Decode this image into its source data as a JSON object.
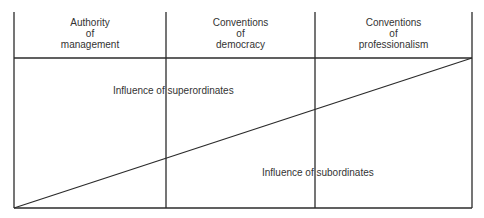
{
  "diagram": {
    "columns": [
      {
        "lines": [
          "Authority",
          "of",
          "management"
        ]
      },
      {
        "lines": [
          "Conventions",
          "of",
          "democracy"
        ]
      },
      {
        "lines": [
          "Conventions",
          "of",
          "professionalism"
        ]
      }
    ],
    "labels": {
      "superordinates": "Influence of superordinates",
      "subordinates": "Influence of subordinates"
    },
    "geometry": {
      "left_x": 14,
      "divider1_x": 166,
      "divider2_x": 315,
      "right_x": 472,
      "top_y": 12,
      "header_bottom_y": 58,
      "bottom_y": 208,
      "diagonal": {
        "x1": 14,
        "y1": 208,
        "x2": 472,
        "y2": 58
      }
    },
    "colors": {
      "line": "#2b2b2b",
      "text": "#333333",
      "background": "#ffffff"
    }
  }
}
